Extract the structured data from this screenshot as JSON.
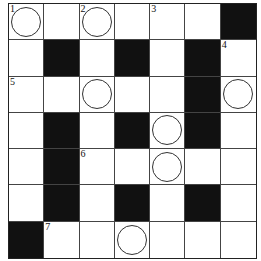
{
  "puzzle": {
    "type": "crossword",
    "rows": 7,
    "cols": 7,
    "cells": [
      [
        {
          "n": "1",
          "c": true
        },
        {},
        {
          "n": "2",
          "c": true
        },
        {},
        {
          "n": "3"
        },
        {},
        {
          "b": true
        }
      ],
      [
        {},
        {
          "b": true
        },
        {},
        {
          "b": true
        },
        {},
        {
          "b": true
        },
        {
          "n": "4"
        }
      ],
      [
        {
          "n": "5"
        },
        {},
        {
          "c": true
        },
        {},
        {},
        {
          "b": true
        },
        {
          "c": true
        }
      ],
      [
        {},
        {
          "b": true
        },
        {},
        {
          "b": true
        },
        {
          "c": true
        },
        {
          "b": true
        },
        {}
      ],
      [
        {},
        {
          "b": true
        },
        {
          "n": "6"
        },
        {},
        {
          "c": true
        },
        {},
        {}
      ],
      [
        {},
        {
          "b": true
        },
        {},
        {
          "b": true
        },
        {},
        {
          "b": true
        },
        {}
      ],
      [
        {
          "b": true
        },
        {
          "n": "7"
        },
        {},
        {
          "c": true
        },
        {},
        {},
        {}
      ]
    ]
  }
}
